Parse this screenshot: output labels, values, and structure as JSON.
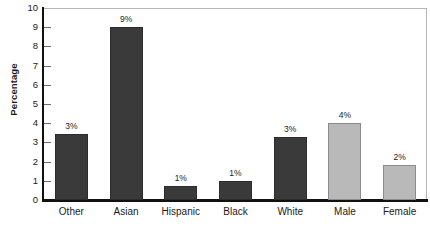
{
  "chart_data": {
    "type": "bar",
    "title": "",
    "xlabel": "",
    "ylabel": "Percentage",
    "ylim": [
      0,
      10
    ],
    "yticks": [
      0,
      1,
      2,
      3,
      4,
      5,
      6,
      7,
      8,
      9,
      10
    ],
    "grid": false,
    "legend": "none",
    "categories": [
      "Other",
      "Asian",
      "Hispanic",
      "Black",
      "White",
      "Male",
      "Female"
    ],
    "values": [
      3.45,
      9.0,
      0.75,
      1.0,
      3.3,
      4.0,
      1.8
    ],
    "data_labels": [
      "3%",
      "9%",
      "1%",
      "1%",
      "3%",
      "4%",
      "2%"
    ],
    "bar_styles": [
      "dark",
      "dark",
      "dark",
      "dark",
      "dark",
      "light",
      "light"
    ]
  },
  "colors": {
    "bar_dark": "#3a3a3a",
    "bar_dark_border": "#2c2c2c",
    "bar_light": "#b9b9b9",
    "bar_light_border": "#8c8c8c",
    "axis": "#111111",
    "frame": "#b5b5b5",
    "text": "#1a1a1a",
    "background": "#ffffff"
  },
  "footer": {
    "clipped_caption": ""
  }
}
